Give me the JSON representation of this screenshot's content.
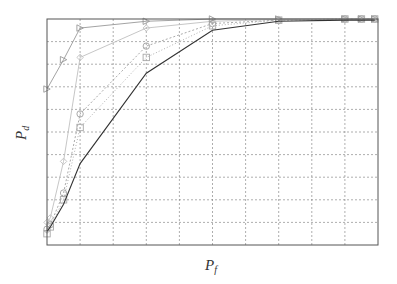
{
  "chart_data": [
    {
      "type": "line",
      "title": "",
      "xlabel": "P_f",
      "ylabel": "P_d",
      "xlim": [
        0,
        1
      ],
      "ylim": [
        0,
        1
      ],
      "grid": true,
      "legend_position": "lower right",
      "x_ticks": [
        "0",
        "0.1",
        "0.2",
        "0.3",
        "0.4",
        "0.5",
        "0.6",
        "0.7",
        "0.8",
        "0.9",
        "1"
      ],
      "y_ticks": [
        "0",
        "0.1",
        "0.2",
        "0.3",
        "0.4",
        "0.5",
        "0.6",
        "0.7",
        "0.8",
        "0.9",
        "1"
      ],
      "series": [
        {
          "name": "DMM",
          "marker": "circle",
          "color": "#a0a0a0",
          "dash": "2,2",
          "x": [
            0,
            0.01,
            0.05,
            0.1,
            0.3,
            0.5,
            0.7,
            0.9,
            0.95,
            0.99
          ],
          "y": [
            0.07,
            0.09,
            0.23,
            0.58,
            0.88,
            0.98,
            0.995,
            1.0,
            1.0,
            1.0
          ]
        },
        {
          "name": "MME",
          "marker": "square",
          "color": "#a8a8a8",
          "dash": "1,2",
          "x": [
            0,
            0.01,
            0.05,
            0.1,
            0.3,
            0.5,
            0.7,
            0.9,
            0.95,
            0.99
          ],
          "y": [
            0.05,
            0.08,
            0.2,
            0.52,
            0.83,
            0.97,
            0.995,
            1.0,
            1.0,
            1.0
          ]
        },
        {
          "name": "DAG",
          "marker": "diamond",
          "color": "#c0c0c0",
          "dash": "",
          "x": [
            0,
            0.01,
            0.05,
            0.1,
            0.3,
            0.5,
            0.7,
            0.9,
            0.95,
            0.99
          ],
          "y": [
            0.1,
            0.12,
            0.37,
            0.83,
            0.96,
            0.99,
            0.998,
            1.0,
            1.0,
            1.0
          ]
        },
        {
          "name": "ED",
          "marker": "triangle-right",
          "color": "#999999",
          "dash": "",
          "x": [
            0,
            0.05,
            0.1,
            0.3,
            0.5,
            0.7,
            0.9,
            0.95,
            0.99
          ],
          "y": [
            0.69,
            0.82,
            0.96,
            0.99,
            1.0,
            1.0,
            1.0,
            1.0,
            1.0
          ]
        },
        {
          "name": "ED-1",
          "marker": "triangle-down",
          "color": "#333333",
          "dash": "",
          "x": [
            0,
            0.01,
            0.05,
            0.1,
            0.3,
            0.5,
            0.7,
            0.9,
            0.95,
            0.99
          ],
          "y": [
            0.06,
            0.08,
            0.18,
            0.36,
            0.76,
            0.95,
            0.99,
            0.995,
            0.995,
            0.995
          ]
        }
      ],
      "insets": [
        {
          "name": "zoom-high",
          "xlim": [
            0.42,
            0.63
          ],
          "ylim": [
            0.88,
            1.0
          ],
          "x_ticks": [
            "0.45",
            "0.5",
            "0.55",
            "0.6"
          ],
          "y_ticks": [
            "0.88",
            "0.9",
            "0.92",
            "0.94",
            "0.96",
            "0.98"
          ]
        },
        {
          "name": "zoom-low",
          "xlim": [
            0.015,
            0.1
          ],
          "ylim": [
            0.135,
            0.355
          ],
          "x_ticks": [
            "0.02",
            "0.04",
            "0.06",
            "0.08",
            "0.1"
          ],
          "y_ticks": [
            "0.15",
            "0.2",
            "0.25",
            "0.3",
            "0.35"
          ]
        }
      ]
    }
  ],
  "labels": {
    "xlabel_main": "P",
    "xlabel_sub": "f",
    "ylabel_main": "P",
    "ylabel_sub": "d"
  },
  "legend": [
    "DMM",
    "MME",
    "DAG",
    "ED",
    "ED-1"
  ]
}
